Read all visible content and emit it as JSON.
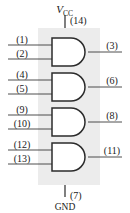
{
  "diagram": {
    "chip_background_color": "#ececec",
    "line_color": "#3a3a3a",
    "gate_outline_color": "#2b2b2b",
    "power": {
      "vcc_label": "V",
      "vcc_subscript": "CC",
      "vcc_pin": "(14)",
      "gnd_label": "GND",
      "gnd_pin": "(7)"
    },
    "gates": [
      {
        "name": "gate-1",
        "inputs": [
          "(1)",
          "(2)"
        ],
        "output": "(3)"
      },
      {
        "name": "gate-2",
        "inputs": [
          "(4)",
          "(5)"
        ],
        "output": "(6)"
      },
      {
        "name": "gate-3",
        "inputs": [
          "(9)",
          "(10)"
        ],
        "output": "(8)"
      },
      {
        "name": "gate-4",
        "inputs": [
          "(12)",
          "(13)"
        ],
        "output": "(11)"
      }
    ]
  }
}
